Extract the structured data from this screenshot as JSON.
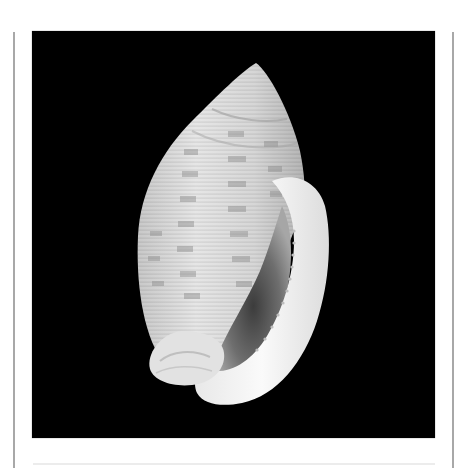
{
  "image": {
    "subject": "Gastropod shell specimen on black background",
    "alt": "Photograph of a pale, spirally ribbed shell with thickened denticulate outer lip, apertural view, on a black background",
    "colors": {
      "background": "#000000",
      "shell_base": "#d8d8d8",
      "shell_bands": "#9a9a9a",
      "lip": "#f4f4f4",
      "aperture_shadow": "#5a5a5a",
      "frame_lines": "#a8a8a8",
      "page": "#ffffff"
    }
  }
}
